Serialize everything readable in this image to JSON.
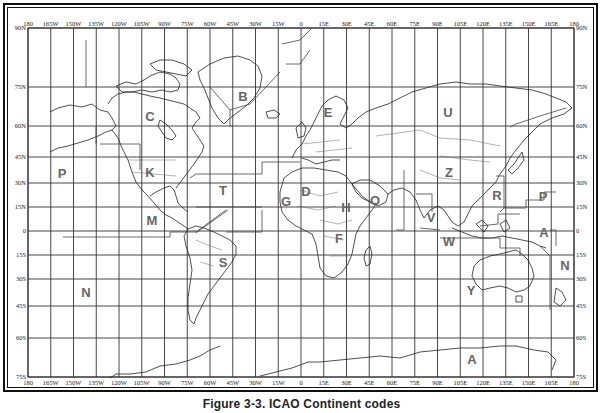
{
  "figure": {
    "caption": "Figure 3-3. ICAO Continent codes"
  },
  "axes": {
    "top_longitude_ticks": [
      "180",
      "165W",
      "150W",
      "135W",
      "120W",
      "105W",
      "90W",
      "75W",
      "60W",
      "45W",
      "30W",
      "15W",
      "0",
      "15E",
      "30E",
      "45E",
      "60E",
      "75E",
      "90E",
      "105E",
      "120E",
      "135E",
      "150E",
      "165E",
      "180"
    ],
    "bottom_longitude_ticks": [
      "180",
      "165W",
      "150W",
      "135W",
      "120W",
      "105W",
      "90W",
      "75W",
      "60W",
      "45W",
      "30W",
      "15W",
      "0",
      "15E",
      "30E",
      "45E",
      "60E",
      "75E",
      "90E",
      "105E",
      "120E",
      "135E",
      "150E",
      "165E",
      "180"
    ],
    "left_latitude_ticks": [
      "90N",
      "75N",
      "60N",
      "45N",
      "30N",
      "15N",
      "0",
      "15S",
      "30S",
      "45S",
      "60S",
      "75S"
    ],
    "right_latitude_ticks": [
      "90N",
      "75N",
      "60N",
      "45N",
      "30N",
      "15N",
      "0",
      "15S",
      "30S",
      "45S",
      "60S",
      "75S"
    ]
  },
  "regions": [
    {
      "code": "B",
      "name": "Greenland / Iceland"
    },
    {
      "code": "C",
      "name": "Canada"
    },
    {
      "code": "K",
      "name": "United States"
    },
    {
      "code": "P",
      "name": "Pacific (Hawaii/Alaska)"
    },
    {
      "code": "T",
      "name": "Caribbean / Western Atlantic"
    },
    {
      "code": "M",
      "name": "Central America"
    },
    {
      "code": "S",
      "name": "South America"
    },
    {
      "code": "N",
      "name": "Southwest Pacific (east)"
    },
    {
      "code": "E",
      "name": "Northern Europe"
    },
    {
      "code": "L",
      "name": "Southern Europe"
    },
    {
      "code": "U",
      "name": "Russia / CIS"
    },
    {
      "code": "Z",
      "name": "China"
    },
    {
      "code": "R",
      "name": "Japan / Korea / Philippines"
    },
    {
      "code": "P",
      "name": "Pacific (western)"
    },
    {
      "code": "G",
      "name": "West Africa"
    },
    {
      "code": "D",
      "name": "Eastern West Africa"
    },
    {
      "code": "H",
      "name": "Northeast Africa"
    },
    {
      "code": "O",
      "name": "Middle East"
    },
    {
      "code": "F",
      "name": "Southern Africa"
    },
    {
      "code": "V",
      "name": "South Asia"
    },
    {
      "code": "W",
      "name": "Southeast Asia / Indonesia"
    },
    {
      "code": "A",
      "name": "Papua New Guinea / Pacific"
    },
    {
      "code": "N",
      "name": "New Zealand / Southwest Pacific"
    },
    {
      "code": "Y",
      "name": "Australia"
    },
    {
      "code": "A",
      "name": "Antarctica"
    }
  ],
  "labels": [
    {
      "text": "B",
      "x": 243,
      "y": 101
    },
    {
      "text": "C",
      "x": 150,
      "y": 121
    },
    {
      "text": "K",
      "x": 150,
      "y": 177
    },
    {
      "text": "P",
      "x": 62,
      "y": 178
    },
    {
      "text": "T",
      "x": 223,
      "y": 195
    },
    {
      "text": "M",
      "x": 152,
      "y": 225
    },
    {
      "text": "G",
      "x": 286,
      "y": 206
    },
    {
      "text": "D",
      "x": 306,
      "y": 196
    },
    {
      "text": "E",
      "x": 328,
      "y": 117
    },
    {
      "text": "U",
      "x": 448,
      "y": 117
    },
    {
      "text": "Z",
      "x": 449,
      "y": 177
    },
    {
      "text": "H",
      "x": 346,
      "y": 212
    },
    {
      "text": "O",
      "x": 375,
      "y": 205
    },
    {
      "text": "R",
      "x": 497,
      "y": 200
    },
    {
      "text": "P",
      "x": 543,
      "y": 201
    },
    {
      "text": "V",
      "x": 431,
      "y": 222
    },
    {
      "text": "W",
      "x": 449,
      "y": 246
    },
    {
      "text": "A",
      "x": 544,
      "y": 237
    },
    {
      "text": "F",
      "x": 339,
      "y": 243
    },
    {
      "text": "S",
      "x": 223,
      "y": 267
    },
    {
      "text": "N",
      "x": 86,
      "y": 297
    },
    {
      "text": "N",
      "x": 565,
      "y": 270
    },
    {
      "text": "Y",
      "x": 471,
      "y": 295
    },
    {
      "text": "A",
      "x": 472,
      "y": 364
    }
  ],
  "colors": {
    "grid": "#333333",
    "label": "#666666",
    "frame": "#111111",
    "background": "#ffffff"
  }
}
